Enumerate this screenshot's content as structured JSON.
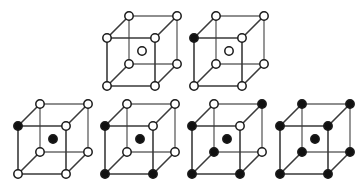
{
  "figure": {
    "background_color": "#ffffff",
    "edge_color": "#3a3a3a",
    "back_edge_color": "#6a6a6a",
    "node_stroke_color": "#1a1a1a",
    "node_open_fill": "#ffffff",
    "node_filled_fill": "#111111",
    "rows": [
      {
        "name": "top-row",
        "count": 2
      },
      {
        "name": "bottom-row",
        "count": 4
      }
    ]
  },
  "geometry": {
    "cube_width": 70,
    "cube_height": 70,
    "front_face_size": 48,
    "depth_dx": 22,
    "depth_dy": -22,
    "node_radius": 4.2,
    "center_radius": 4.2,
    "top_row_y": 8,
    "bottom_row_y": 96,
    "top_row_x": [
      99,
      186
    ],
    "bottom_row_x": [
      10,
      97,
      184,
      272
    ]
  },
  "cells": [
    {
      "id": "cell-1",
      "label": "cube-top-left",
      "row": "top",
      "index": 0,
      "x": 99,
      "y": 8,
      "vertices": {
        "front_top_left": "open",
        "front_top_right": "open",
        "front_bottom_left": "open",
        "front_bottom_right": "open",
        "back_top_left": "open",
        "back_top_right": "open",
        "back_bottom_left": "open",
        "back_bottom_right": "open"
      },
      "center": "open",
      "filled_count": 0,
      "open_count": 8
    },
    {
      "id": "cell-2",
      "label": "cube-top-right",
      "row": "top",
      "index": 1,
      "x": 186,
      "y": 8,
      "vertices": {
        "front_top_left": "filled",
        "front_top_right": "open",
        "front_bottom_left": "open",
        "front_bottom_right": "open",
        "back_top_left": "open",
        "back_top_right": "open",
        "back_bottom_left": "open",
        "back_bottom_right": "open"
      },
      "center": "open",
      "filled_count": 1,
      "open_count": 7
    },
    {
      "id": "cell-3",
      "label": "cube-bottom-1",
      "row": "bottom",
      "index": 0,
      "x": 10,
      "y": 96,
      "vertices": {
        "front_top_left": "filled",
        "front_top_right": "open",
        "front_bottom_left": "open",
        "front_bottom_right": "open",
        "back_top_left": "open",
        "back_top_right": "open",
        "back_bottom_left": "open",
        "back_bottom_right": "open"
      },
      "center": "filled",
      "filled_count": 1,
      "open_count": 7
    },
    {
      "id": "cell-4",
      "label": "cube-bottom-2",
      "row": "bottom",
      "index": 1,
      "x": 97,
      "y": 96,
      "vertices": {
        "front_top_left": "filled",
        "front_top_right": "open",
        "front_bottom_left": "filled",
        "front_bottom_right": "filled",
        "back_top_left": "open",
        "back_top_right": "open",
        "back_bottom_left": "open",
        "back_bottom_right": "open"
      },
      "center": "filled",
      "filled_count": 3,
      "open_count": 5
    },
    {
      "id": "cell-5",
      "label": "cube-bottom-3",
      "row": "bottom",
      "index": 2,
      "x": 184,
      "y": 96,
      "vertices": {
        "front_top_left": "filled",
        "front_top_right": "open",
        "front_bottom_left": "filled",
        "front_bottom_right": "filled",
        "back_top_left": "open",
        "back_top_right": "filled",
        "back_bottom_left": "filled",
        "back_bottom_right": "open"
      },
      "center": "filled",
      "filled_count": 5,
      "open_count": 3
    },
    {
      "id": "cell-6",
      "label": "cube-bottom-4",
      "row": "bottom",
      "index": 3,
      "x": 272,
      "y": 96,
      "vertices": {
        "front_top_left": "filled",
        "front_top_right": "filled",
        "front_bottom_left": "filled",
        "front_bottom_right": "filled",
        "back_top_left": "filled",
        "back_top_right": "filled",
        "back_bottom_left": "filled",
        "back_bottom_right": "filled"
      },
      "center": "filled",
      "filled_count": 8,
      "open_count": 0
    }
  ]
}
